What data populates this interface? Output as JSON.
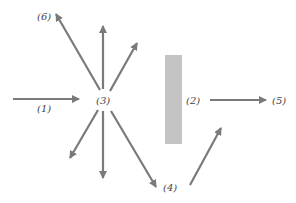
{
  "diagram": {
    "colors": {
      "arrow": "#7a7a7a",
      "barrier": "#c4c4c4",
      "label": "#444444"
    },
    "labels": {
      "l1": "(1)",
      "l2": "(2)",
      "l3": "(3)",
      "l4": "(4)",
      "l5": "(5)",
      "l6": "(6)"
    }
  }
}
